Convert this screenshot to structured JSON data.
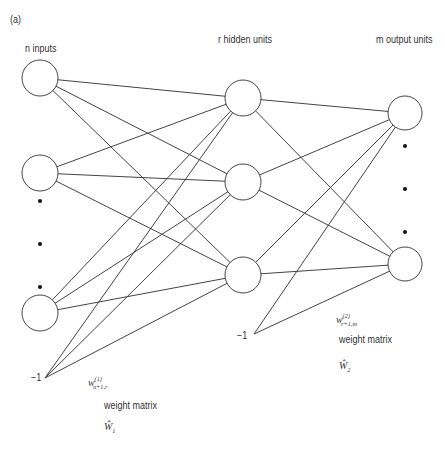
{
  "panel_label": "(a)",
  "layers": {
    "input": {
      "label": "n inputs"
    },
    "hidden": {
      "label": "r hidden units"
    },
    "output": {
      "label": "m output units"
    }
  },
  "bias": {
    "layer1_label": "−1",
    "layer2_label": "−1"
  },
  "weights": {
    "layer1": {
      "symbol": "w",
      "superscript": "(1)",
      "subscript": "n+1,r",
      "caption": "weight matrix",
      "matrix_symbol": "Ŵ",
      "matrix_index": "1"
    },
    "layer2": {
      "symbol": "w",
      "superscript": "(2)",
      "subscript": "r+1,m",
      "caption": "weight matrix",
      "matrix_symbol": "Ŵ",
      "matrix_index": "2"
    }
  },
  "colors": {
    "stroke": "#444444",
    "dot": "#111111",
    "text": "#333333"
  }
}
